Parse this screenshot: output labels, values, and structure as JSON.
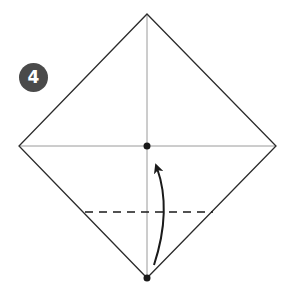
{
  "diagram": {
    "type": "origami-step",
    "step": {
      "number": "4",
      "badge_color": "#4a4a4a",
      "text_color": "#ffffff"
    },
    "square": {
      "shape": "diamond",
      "vertices": {
        "top": [
          147,
          14
        ],
        "right": [
          276,
          146
        ],
        "bottom": [
          147,
          278
        ],
        "left": [
          19,
          146
        ]
      },
      "outline_color": "#2b2b2b"
    },
    "crease_lines": [
      {
        "name": "vertical-crease",
        "from": [
          147,
          14
        ],
        "to": [
          147,
          278
        ],
        "color": "#9a9a9a"
      },
      {
        "name": "horizontal-crease",
        "from": [
          19,
          146
        ],
        "to": [
          276,
          146
        ],
        "color": "#9a9a9a"
      }
    ],
    "fold_line": {
      "style": "dashed",
      "from": [
        85,
        212
      ],
      "to": [
        213,
        212
      ],
      "color": "#1a1a1a"
    },
    "points": [
      {
        "name": "center-point",
        "at": [
          147,
          146
        ]
      },
      {
        "name": "bottom-point",
        "at": [
          147,
          278
        ]
      }
    ],
    "arrow": {
      "meaning": "fold bottom corner up to center",
      "from": [
        154,
        265
      ],
      "control": [
        172,
        210
      ],
      "to": [
        156,
        163
      ],
      "color": "#1a1a1a"
    }
  }
}
